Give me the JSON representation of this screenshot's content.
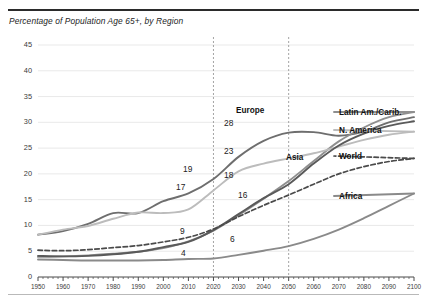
{
  "chart_title": "Percentage of Population Age 65+, by Region",
  "axis": {
    "y_ticks": [
      "0",
      "5",
      "10",
      "15",
      "20",
      "25",
      "30",
      "35",
      "40",
      "45"
    ],
    "x_ticks": [
      "1950",
      "1960",
      "1970",
      "1980",
      "1990",
      "2000",
      "2010",
      "2020",
      "2030",
      "2040",
      "2050",
      "2060",
      "2070",
      "2080",
      "2090",
      "2100"
    ]
  },
  "series_labels": {
    "europe": "Europe",
    "latin": "Latin Am./Carib.",
    "namerica": "N. America",
    "asia": "Asia",
    "world": "World",
    "africa": "Africa"
  },
  "value_labels": {
    "v19": "19",
    "v17": "17",
    "v9": "9",
    "v4": "4",
    "v28": "28",
    "v23": "23",
    "v18": "18",
    "v16": "16",
    "v6": "6"
  },
  "colors": {
    "europe": "#6e6e6e",
    "latin": "#8f8f8f",
    "namerica": "#bcbcbc",
    "asia": "#5a5a5a",
    "world": "#4a4a4a",
    "africa": "#8a8a8a",
    "grid": "#e6e6e6",
    "axis": "#4a4a4a",
    "marker": "#9a9a9a"
  },
  "chart_data": {
    "type": "line",
    "title": "Percentage of Population Age 65+, by Region",
    "xlabel": "",
    "ylabel": "",
    "xlim": [
      1950,
      2100
    ],
    "ylim": [
      0,
      45
    ],
    "grid": true,
    "legend_position": "right-inline",
    "x": [
      1950,
      1960,
      1970,
      1980,
      1990,
      2000,
      2010,
      2020,
      2030,
      2040,
      2050,
      2060,
      2070,
      2080,
      2090,
      2100
    ],
    "annotations": [
      {
        "text": "19",
        "x": 2020,
        "y": 19,
        "series": "Europe"
      },
      {
        "text": "17",
        "x": 2020,
        "y": 17,
        "series": "Latin Am./Carib."
      },
      {
        "text": "9",
        "x": 2020,
        "y": 9,
        "series": "World"
      },
      {
        "text": "4",
        "x": 2020,
        "y": 4,
        "series": "Africa"
      },
      {
        "text": "28",
        "x": 2050,
        "y": 28,
        "series": "Europe"
      },
      {
        "text": "23",
        "x": 2050,
        "y": 23,
        "series": "N. America"
      },
      {
        "text": "18",
        "x": 2050,
        "y": 18,
        "series": "Asia"
      },
      {
        "text": "16",
        "x": 2050,
        "y": 16,
        "series": "World"
      },
      {
        "text": "6",
        "x": 2050,
        "y": 6,
        "series": "Africa"
      }
    ],
    "vertical_markers": [
      2020,
      2050
    ],
    "series": [
      {
        "name": "Europe",
        "style": "solid",
        "color": "#6e6e6e",
        "values": [
          8.2,
          8.9,
          10.3,
          12.4,
          12.4,
          14.7,
          16.2,
          19.0,
          23.3,
          26.4,
          28.0,
          28.1,
          27.4,
          28.2,
          30.0,
          31.0
        ]
      },
      {
        "name": "Latin Am./Carib.",
        "style": "solid",
        "color": "#8f8f8f",
        "values": [
          3.9,
          4.0,
          4.2,
          4.5,
          4.9,
          5.6,
          6.9,
          9.0,
          12.0,
          15.2,
          18.6,
          22.5,
          26.3,
          29.0,
          31.0,
          32.0
        ]
      },
      {
        "name": "N. America",
        "style": "solid",
        "color": "#bcbcbc",
        "values": [
          8.2,
          9.2,
          9.9,
          11.3,
          12.5,
          12.4,
          13.1,
          16.8,
          20.5,
          22.0,
          23.0,
          24.0,
          25.3,
          26.6,
          27.6,
          28.2
        ]
      },
      {
        "name": "Asia",
        "style": "solid",
        "color": "#5a5a5a",
        "values": [
          4.1,
          4.0,
          4.1,
          4.4,
          4.9,
          5.8,
          6.8,
          9.1,
          12.2,
          15.3,
          18.0,
          22.0,
          25.5,
          27.8,
          29.3,
          30.2
        ]
      },
      {
        "name": "World",
        "style": "dashed",
        "color": "#4a4a4a",
        "values": [
          5.2,
          5.1,
          5.3,
          5.7,
          6.1,
          6.8,
          7.7,
          9.3,
          11.7,
          13.9,
          15.9,
          18.0,
          20.0,
          21.4,
          22.4,
          23.0
        ]
      },
      {
        "name": "Africa",
        "style": "solid",
        "color": "#8a8a8a",
        "values": [
          3.4,
          3.3,
          3.2,
          3.2,
          3.2,
          3.3,
          3.5,
          3.6,
          4.3,
          5.1,
          6.0,
          7.4,
          9.2,
          11.4,
          13.8,
          16.2
        ]
      }
    ]
  }
}
